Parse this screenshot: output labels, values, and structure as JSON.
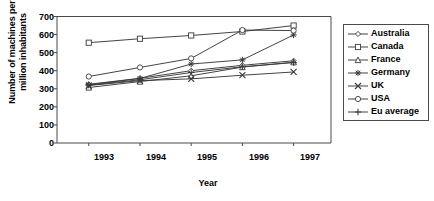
{
  "chart_data": {
    "type": "line",
    "title": "",
    "xlabel": "Year",
    "ylabel": "Number of machines per million inhabitants",
    "categories": [
      "1993",
      "1994",
      "1995",
      "1996",
      "1997"
    ],
    "x": [
      1993,
      1994,
      1995,
      1996,
      1997
    ],
    "xlim": [
      1992.5,
      1997.5
    ],
    "ylim": [
      0,
      700
    ],
    "yticks": [
      0,
      100,
      200,
      300,
      400,
      500,
      600,
      700
    ],
    "grid": false,
    "legend_position": "right-outside",
    "series": [
      {
        "name": "Australia",
        "marker": "diamond",
        "values": [
          325,
          358,
          400,
          430,
          455
        ]
      },
      {
        "name": "Canada",
        "marker": "square",
        "values": [
          555,
          577,
          595,
          617,
          650
        ]
      },
      {
        "name": "France",
        "marker": "triangle",
        "values": [
          307,
          340,
          372,
          420,
          447
        ]
      },
      {
        "name": "Germany",
        "marker": "star",
        "values": [
          322,
          357,
          437,
          460,
          598
        ]
      },
      {
        "name": "UK",
        "marker": "cross-x",
        "values": [
          318,
          345,
          355,
          375,
          393
        ]
      },
      {
        "name": "USA",
        "marker": "circle",
        "values": [
          368,
          418,
          468,
          625,
          622
        ]
      },
      {
        "name": "Eu average",
        "marker": "plus",
        "values": [
          320,
          350,
          390,
          422,
          445
        ]
      }
    ]
  },
  "axes": {
    "ytick_labels": [
      "700",
      "600",
      "500",
      "400",
      "300",
      "200",
      "100",
      "0"
    ],
    "xtick_labels": [
      "1993",
      "1994",
      "1995",
      "1996",
      "1997"
    ],
    "x_axis_title": "Year",
    "y_axis_title": "Number of machines per million inhabitants"
  },
  "legend": {
    "items": [
      {
        "label": "Australia",
        "marker": "diamond-marker-icon"
      },
      {
        "label": "Canada",
        "marker": "square-marker-icon"
      },
      {
        "label": "France",
        "marker": "triangle-marker-icon"
      },
      {
        "label": "Germany",
        "marker": "star-marker-icon"
      },
      {
        "label": "UK",
        "marker": "x-marker-icon"
      },
      {
        "label": "USA",
        "marker": "circle-marker-icon"
      },
      {
        "label": "Eu average",
        "marker": "plus-marker-icon"
      }
    ]
  },
  "style": {
    "line_color": "#3a3a3a",
    "frame_color": "#4a4a4a",
    "text_color": "#000000",
    "background": "#ffffff"
  }
}
